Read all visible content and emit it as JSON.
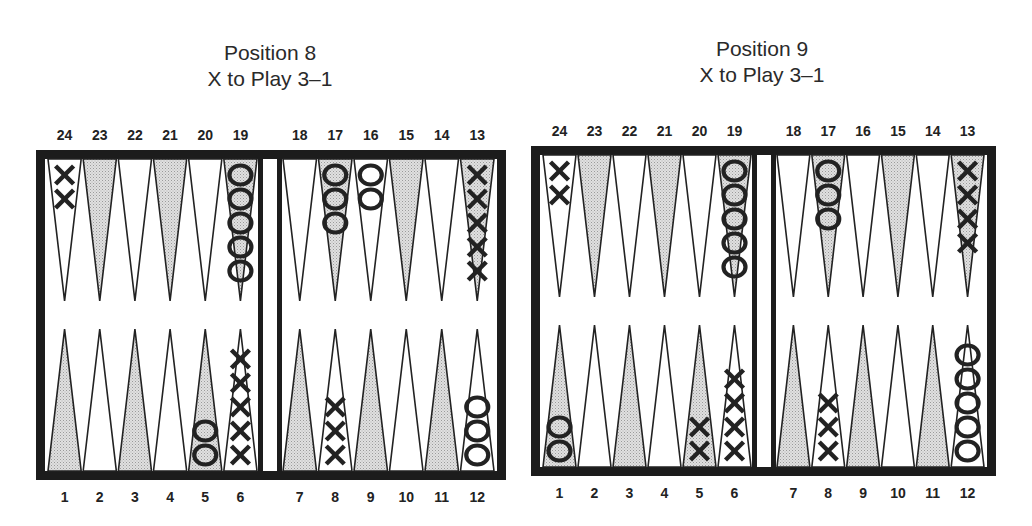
{
  "diagrams": [
    {
      "title_line1": "Position 8",
      "title_line2": "X to Play 3–1",
      "frame": {
        "x": 36,
        "y": 150,
        "w": 470,
        "h": 330,
        "border": 9
      },
      "bar": {
        "x1": 258,
        "x2": 282
      },
      "top_labels": [
        "24",
        "23",
        "22",
        "21",
        "20",
        "19",
        "18",
        "17",
        "16",
        "15",
        "14",
        "13"
      ],
      "bottom_labels": [
        "1",
        "2",
        "3",
        "4",
        "5",
        "6",
        "7",
        "8",
        "9",
        "10",
        "11",
        "12"
      ],
      "checkers": [
        {
          "point": 24,
          "type": "X",
          "count": 2
        },
        {
          "point": 19,
          "type": "O",
          "count": 5
        },
        {
          "point": 17,
          "type": "O",
          "count": 3
        },
        {
          "point": 16,
          "type": "O",
          "count": 2
        },
        {
          "point": 13,
          "type": "X",
          "count": 5
        },
        {
          "point": 5,
          "type": "O",
          "count": 2
        },
        {
          "point": 6,
          "type": "X",
          "count": 5
        },
        {
          "point": 8,
          "type": "X",
          "count": 3
        },
        {
          "point": 12,
          "type": "O",
          "count": 3
        }
      ]
    },
    {
      "title_line1": "Position 9",
      "title_line2": "X to Play 3–1",
      "frame": {
        "x": 531,
        "y": 146,
        "w": 465,
        "h": 330,
        "border": 9
      },
      "bar": {
        "x1": 752,
        "x2": 776
      },
      "top_labels": [
        "24",
        "23",
        "22",
        "21",
        "20",
        "19",
        "18",
        "17",
        "16",
        "15",
        "14",
        "13"
      ],
      "bottom_labels": [
        "1",
        "2",
        "3",
        "4",
        "5",
        "6",
        "7",
        "8",
        "9",
        "10",
        "11",
        "12"
      ],
      "checkers": [
        {
          "point": 24,
          "type": "X",
          "count": 2
        },
        {
          "point": 19,
          "type": "O",
          "count": 5
        },
        {
          "point": 17,
          "type": "O",
          "count": 3
        },
        {
          "point": 13,
          "type": "X",
          "count": 4
        },
        {
          "point": 1,
          "type": "O",
          "count": 2
        },
        {
          "point": 5,
          "type": "X",
          "count": 2
        },
        {
          "point": 6,
          "type": "X",
          "count": 4
        },
        {
          "point": 8,
          "type": "X",
          "count": 3
        },
        {
          "point": 12,
          "type": "O",
          "count": 5
        }
      ]
    }
  ],
  "colors": {
    "frame": "#1c1c1c",
    "shaded_point": "#cfcfcf",
    "white_point": "#ffffff",
    "checker_stroke": "#222222"
  }
}
